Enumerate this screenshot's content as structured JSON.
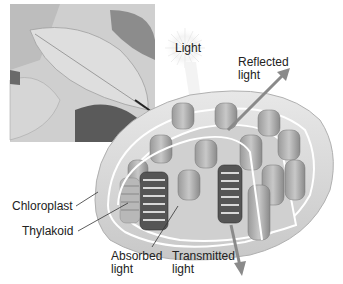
{
  "diagram": {
    "title": "",
    "labels": {
      "light": "Light",
      "reflected_light": "Reflected\nlight",
      "chloroplast": "Chloroplast",
      "thylakoid": "Thylakoid",
      "absorbed_light": "Absorbed\nlight",
      "transmitted_light": "Transmitted\nlight"
    },
    "inset": {
      "subject": "leaves-photo",
      "color_mode": "grayscale"
    },
    "colors": {
      "background": "#ffffff",
      "text": "#222222",
      "arrow": "#8a8a8a",
      "body": "#d9d9d9",
      "stack": "#b5b5b5",
      "stack_dark": "#4a4a4a"
    }
  }
}
